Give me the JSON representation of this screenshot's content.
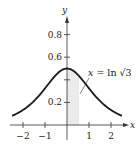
{
  "chart_data": {
    "type": "line",
    "title": "",
    "function": "y = 1 / (e^x + e^-x)",
    "xlabel": "x",
    "ylabel": "y",
    "xlim": [
      -2.5,
      2.5
    ],
    "ylim": [
      0,
      1.0
    ],
    "x_ticks": [
      {
        "value": -2,
        "label": "-2"
      },
      {
        "value": -1,
        "label": "-1"
      },
      {
        "value": 0,
        "label": ""
      },
      {
        "value": 1,
        "label": "1"
      },
      {
        "value": 2,
        "label": "2"
      }
    ],
    "y_ticks": [
      {
        "value": 0.2,
        "label": "0.2"
      },
      {
        "value": 0.4,
        "label": ""
      },
      {
        "value": 0.6,
        "label": "0.6"
      },
      {
        "value": 0.8,
        "label": "0.8"
      }
    ],
    "series": [
      {
        "name": "curve",
        "x": [
          -2.4,
          -2.0,
          -1.5,
          -1.0,
          -0.5,
          0.0,
          0.5,
          1.0,
          1.5,
          2.0,
          2.4
        ],
        "y": [
          0.089,
          0.133,
          0.213,
          0.324,
          0.443,
          0.5,
          0.443,
          0.324,
          0.213,
          0.133,
          0.089
        ]
      }
    ],
    "shaded_region": {
      "x_from": 0,
      "x_to": 0.5493,
      "under": "curve"
    },
    "annotation": {
      "text_var": "x",
      "text_eq": " = ln ",
      "text_root": "√3",
      "points_to_x": 0.5493
    },
    "grid": false,
    "legend": "none"
  },
  "colors": {
    "curve": "#1a1a1a",
    "axis": "#333333",
    "shade": "#ebebeb"
  }
}
